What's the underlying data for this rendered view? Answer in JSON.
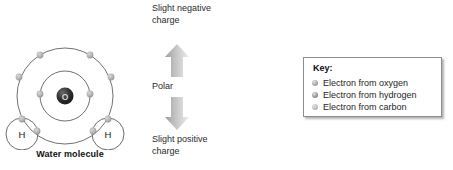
{
  "molecule": {
    "caption": "Water molecule",
    "nucleus_label": "O",
    "hydrogen_left_label": "H",
    "hydrogen_right_label": "H",
    "shell_line_color": "#6e6e6e",
    "nucleus_color": "#2b2b2b",
    "electron_color": "#b4b4b4"
  },
  "polarity": {
    "negative_label": "Slight negative charge",
    "middle_label": "Polar",
    "positive_label": "Slight positive charge",
    "arrow_up_icon": "arrow-up-icon",
    "arrow_down_icon": "arrow-down-icon",
    "arrow_color": "#b9b9b9"
  },
  "key": {
    "title": "Key:",
    "items": [
      {
        "label": "Electron from oxygen",
        "dot_color": "#a3a3a3"
      },
      {
        "label": "Electron from hydrogen",
        "dot_color": "#8f8f8f"
      },
      {
        "label": "Electron from carbon",
        "dot_color": "#bcbcbc"
      }
    ]
  }
}
